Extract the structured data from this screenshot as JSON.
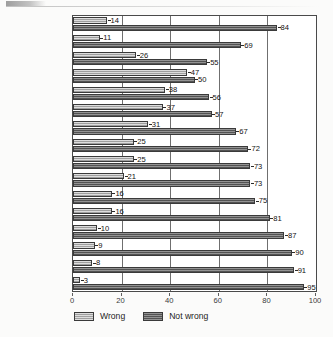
{
  "chart_data": {
    "type": "bar",
    "orientation": "horizontal",
    "title": "",
    "xlabel": "",
    "ylabel": "",
    "xlim": [
      0,
      100
    ],
    "xticks": [
      0,
      20,
      40,
      60,
      80,
      100
    ],
    "grid": "vertical",
    "legend_position": "bottom-left",
    "categories": [
      "India",
      "Singapore",
      "Taiwan",
      "United States",
      "Guatemala",
      "Thailand",
      "Mexico",
      "Canada",
      "Great Britain",
      "Spain",
      "Lithuania",
      "Hungary",
      "Colombia",
      "Germany",
      "France",
      "Iceland"
    ],
    "series": [
      {
        "name": "Wrong",
        "color": "#b4b4b4",
        "values": [
          14,
          11,
          26,
          47,
          38,
          37,
          31,
          25,
          25,
          21,
          16,
          16,
          10,
          9,
          8,
          3
        ]
      },
      {
        "name": "Not wrong",
        "color": "#6a6a6a",
        "values": [
          84,
          69,
          55,
          50,
          56,
          57,
          67,
          72,
          73,
          73,
          75,
          81,
          87,
          90,
          91,
          95
        ]
      }
    ]
  },
  "legend": {
    "items": [
      {
        "label": "Wrong"
      },
      {
        "label": "Not wrong"
      }
    ]
  }
}
